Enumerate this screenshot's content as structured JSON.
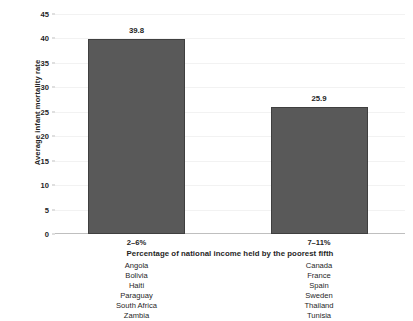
{
  "chart_data": {
    "type": "bar",
    "title": "",
    "xlabel": "Percentage of national income held by the poorest fifth",
    "ylabel": "Average infant mortality rate",
    "categories": [
      "2–6%",
      "7–11%"
    ],
    "values": [
      39.8,
      25.9
    ],
    "value_labels": [
      "39.8",
      "25.9"
    ],
    "ylim": [
      0,
      45
    ],
    "yticks": [
      0,
      5,
      10,
      15,
      20,
      25,
      30,
      35,
      40,
      45
    ],
    "ytick_labels": [
      "0",
      "5",
      "10",
      "15",
      "20",
      "25",
      "30",
      "35",
      "40",
      "45"
    ],
    "grid": true,
    "legend": false,
    "bar_color": "#595959",
    "bar_border_color": "#3f3f3f",
    "axis_color": "#bfbfbf",
    "gridline_color": "#f2f2f2",
    "text_color": "#1f1f1f",
    "groups": [
      {
        "category": "2–6%",
        "value": 39.8,
        "countries": [
          "Angola",
          "Bolivia",
          "Haiti",
          "Paraguay",
          "South Africa",
          "Zambia"
        ]
      },
      {
        "category": "7–11%",
        "value": 25.9,
        "countries": [
          "Canada",
          "France",
          "Spain",
          "Sweden",
          "Thailand",
          "Tunisia"
        ]
      }
    ]
  }
}
